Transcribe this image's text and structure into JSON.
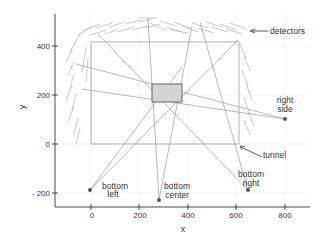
{
  "axes": {
    "xlabel": "x",
    "ylabel": "y",
    "x_ticks": [
      "0",
      "200",
      "400",
      "600",
      "800"
    ],
    "y_ticks": [
      "400",
      "200",
      "0",
      "- 200"
    ]
  },
  "annotations": {
    "detectors": "detectors",
    "tunnel": "tunnel"
  },
  "sources": [
    {
      "name": "bottom-left",
      "line1": "bottom",
      "line2": "left",
      "x": -5,
      "y": -190
    },
    {
      "name": "bottom-center",
      "line1": "bottom",
      "line2": "center",
      "x": 280,
      "y": -230
    },
    {
      "name": "bottom-right",
      "line1": "bottom",
      "line2": "right",
      "x": 650,
      "y": -190
    },
    {
      "name": "right-side",
      "line1": "right",
      "line2": "side",
      "x": 800,
      "y": 100
    }
  ],
  "regions": {
    "tunnel": {
      "x0": 0,
      "y0": 0,
      "x1": 610,
      "y1": 420
    },
    "target_box": {
      "x0": 250,
      "y0": 170,
      "x1": 375,
      "y1": 245
    }
  },
  "colors": {
    "axis": "#333333",
    "ray": "#999999",
    "tunnel": "#aaaaaa",
    "detector": "#bbbbbb",
    "target_fill": "#d4d4d4",
    "target_stroke": "#666666",
    "source": "#555555"
  }
}
